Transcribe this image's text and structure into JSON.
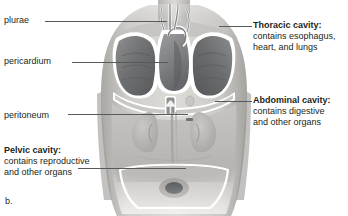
{
  "figure": {
    "caption": "b.",
    "colors": {
      "text": "#231f20",
      "leader_line": "#58595b",
      "cavity_outline": "#ffffff",
      "lung_fill": "#6f7173",
      "skin_light": "#d8d6d3",
      "skin_mid": "#b9b7b4",
      "background": "#ffffff"
    }
  },
  "labels": {
    "plurae": {
      "text": "plurae",
      "bold": false
    },
    "pericardium": {
      "text": "pericardium",
      "bold": false
    },
    "peritoneum": {
      "text": "peritoneum",
      "bold": false
    },
    "pelvic_cavity": {
      "heading": "Pelvic cavity:",
      "line1": "contains reproductive",
      "line2": "and other organs"
    },
    "thoracic_cavity": {
      "heading": "Thoracic cavity:",
      "line1": "contains esophagus,",
      "line2": "heart, and lungs"
    },
    "abdominal_cavity": {
      "heading": "Abdominal cavity:",
      "line1": "contains digestive",
      "line2": "and other organs"
    }
  },
  "anatomy_parts": [
    "right-lung",
    "left-lung",
    "heart",
    "aorta",
    "trachea",
    "diaphragm",
    "kidney-left",
    "kidney-right",
    "stomach",
    "pelvic-bowl",
    "pubic-region"
  ]
}
